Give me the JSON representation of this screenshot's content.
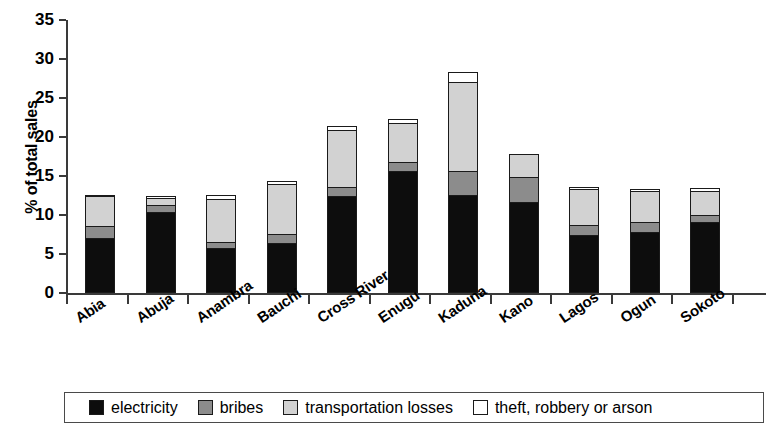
{
  "chart_data": {
    "type": "bar",
    "subtype": "stacked-bar",
    "title": "",
    "xlabel": "",
    "ylabel": "% of total sales",
    "ylim": [
      0,
      35
    ],
    "yticks": [
      0,
      5,
      10,
      15,
      20,
      25,
      30,
      35
    ],
    "grid": false,
    "legend_position": "bottom",
    "categories": [
      "Abia",
      "Abuja",
      "Anambra",
      "Bauchi",
      "Cross River",
      "Enugu",
      "Kaduna",
      "Kano",
      "Lagos",
      "Ogun",
      "Sokoto"
    ],
    "series": [
      {
        "name": "electricity",
        "color": "#0d0d0d",
        "values": [
          7.0,
          10.4,
          5.8,
          6.4,
          12.5,
          15.6,
          12.6,
          11.7,
          7.5,
          7.8,
          9.1
        ]
      },
      {
        "name": "bribes",
        "color": "#8c8c8c",
        "values": [
          1.7,
          1.0,
          0.9,
          1.3,
          1.2,
          1.3,
          3.2,
          3.3,
          1.3,
          1.4,
          1.0
        ]
      },
      {
        "name": "transportation losses",
        "color": "#d2d2d2",
        "values": [
          4.0,
          1.0,
          5.6,
          6.5,
          7.4,
          5.2,
          11.5,
          3.1,
          4.8,
          4.1,
          3.3
        ]
      },
      {
        "name": "theft, robbery or arson",
        "color": "#ffffff",
        "values": [
          0.3,
          0.4,
          0.6,
          0.6,
          0.7,
          0.6,
          1.4,
          0.0,
          0.4,
          0.4,
          0.4
        ]
      }
    ],
    "totals": [
      13.0,
      12.8,
      12.9,
      14.8,
      21.8,
      22.7,
      28.7,
      18.1,
      14.0,
      13.7,
      13.8
    ]
  },
  "legend": {
    "items": [
      {
        "label": "electricity",
        "swatch": "electricity"
      },
      {
        "label": "bribes",
        "swatch": "bribes"
      },
      {
        "label": "transportation losses",
        "swatch": "transportation"
      },
      {
        "label": "theft, robbery or arson",
        "swatch": "theft"
      }
    ]
  }
}
